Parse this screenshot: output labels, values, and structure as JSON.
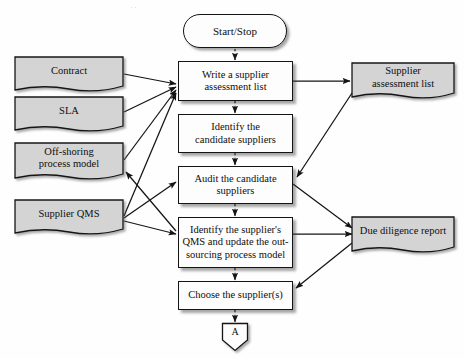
{
  "diagram": {
    "colors": {
      "document_fill": "#d4d4d4",
      "process_fill": "#fdfdfd",
      "stroke": "#141414",
      "background": "#fefefe"
    },
    "terminator": {
      "label": "Start/Stop"
    },
    "processes": [
      {
        "id": "p1",
        "label": "Write a supplier\nassessment list"
      },
      {
        "id": "p2",
        "label": "Identify the\ncandidate suppliers"
      },
      {
        "id": "p3",
        "label": "Audit the candidate\nsuppliers"
      },
      {
        "id": "p4",
        "label": "Identify the supplier's\nQMS and update the out-\nsourcing process model"
      },
      {
        "id": "p5",
        "label": "Choose the supplier(s)"
      }
    ],
    "input_documents": [
      {
        "id": "d1",
        "label": "Contract"
      },
      {
        "id": "d2",
        "label": "SLA"
      },
      {
        "id": "d3",
        "label": "Off-shoring\nprocess model"
      },
      {
        "id": "d4",
        "label": "Supplier QMS"
      }
    ],
    "output_documents": [
      {
        "id": "o1",
        "label": "Supplier\nassessment list"
      },
      {
        "id": "o2",
        "label": "Due diligence report"
      }
    ],
    "connector": {
      "label": "A",
      "type": "off-page-connector"
    },
    "flow_edges": [
      {
        "from": "Start/Stop",
        "to": "Write a supplier assessment list",
        "style": "dotted"
      },
      {
        "from": "Write a supplier assessment list",
        "to": "Identify the candidate suppliers",
        "style": "dotted"
      },
      {
        "from": "Identify the candidate suppliers",
        "to": "Audit the candidate suppliers",
        "style": "dotted"
      },
      {
        "from": "Audit the candidate suppliers",
        "to": "Identify the supplier's QMS and update the out-sourcing process model",
        "style": "dotted"
      },
      {
        "from": "Identify the supplier's QMS and update the out-sourcing process model",
        "to": "Choose the supplier(s)",
        "style": "dotted"
      },
      {
        "from": "Choose the supplier(s)",
        "to": "A",
        "style": "dotted"
      },
      {
        "from": "Contract",
        "to": "Write a supplier assessment list",
        "style": "solid"
      },
      {
        "from": "SLA",
        "to": "Write a supplier assessment list",
        "style": "solid"
      },
      {
        "from": "Off-shoring process model",
        "to": "Write a supplier assessment list",
        "style": "solid"
      },
      {
        "from": "Supplier QMS",
        "to": "Write a supplier assessment list",
        "style": "solid"
      },
      {
        "from": "Supplier QMS",
        "to": "Audit the candidate suppliers",
        "style": "solid"
      },
      {
        "from": "Supplier QMS",
        "to": "Identify the supplier's QMS and update the out-sourcing process model",
        "style": "solid"
      },
      {
        "from": "Write a supplier assessment list",
        "to": "Supplier assessment list",
        "style": "solid"
      },
      {
        "from": "Supplier assessment list",
        "to": "Audit the candidate suppliers",
        "style": "solid"
      },
      {
        "from": "Audit the candidate suppliers",
        "to": "Due diligence report",
        "style": "solid"
      },
      {
        "from": "Identify the supplier's QMS and update the out-sourcing process model",
        "to": "Due diligence report",
        "style": "solid"
      },
      {
        "from": "Identify the supplier's QMS and update the out-sourcing process model",
        "to": "Off-shoring process model",
        "style": "solid"
      },
      {
        "from": "Due diligence report",
        "to": "Choose the supplier(s)",
        "style": "solid"
      }
    ]
  }
}
